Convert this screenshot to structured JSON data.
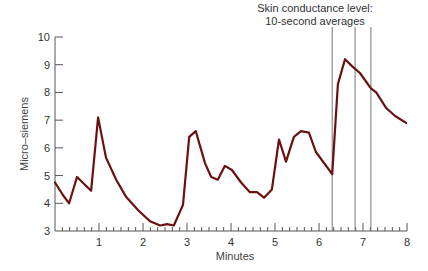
{
  "chart_data": {
    "type": "line",
    "title": "Skin conductance level:\n10-second averages",
    "title_lines": [
      "Skin conductance level:",
      "10-second averages"
    ],
    "xlabel": "Minutes",
    "ylabel": "Micro–siemens",
    "xlim": [
      0,
      8
    ],
    "ylim": [
      3,
      10
    ],
    "x_ticks": [
      1,
      2,
      3,
      4,
      5,
      6,
      7,
      8
    ],
    "y_ticks": [
      3,
      4,
      5,
      6,
      7,
      8,
      9,
      10
    ],
    "grid": false,
    "legend": null,
    "line_color": "#6b1010",
    "vertical_markers_minutes": [
      6.3,
      6.82,
      7.18
    ],
    "series": [
      {
        "name": "Skin conductance level",
        "x": [
          0,
          0.18,
          0.32,
          0.5,
          0.82,
          0.98,
          1.16,
          1.39,
          1.61,
          1.89,
          2.16,
          2.39,
          2.55,
          2.7,
          2.84,
          2.91,
          3.05,
          3.2,
          3.41,
          3.55,
          3.7,
          3.86,
          4.02,
          4.23,
          4.43,
          4.59,
          4.75,
          4.93,
          5.09,
          5.25,
          5.43,
          5.59,
          5.77,
          5.93,
          6.3,
          6.43,
          6.59,
          6.75,
          6.93,
          7.18,
          7.3,
          7.52,
          7.73,
          7.98
        ],
        "y": [
          4.75,
          4.3,
          4.0,
          4.95,
          4.45,
          7.1,
          5.65,
          4.85,
          4.25,
          3.75,
          3.35,
          3.2,
          3.25,
          3.2,
          3.7,
          3.95,
          6.4,
          6.6,
          5.45,
          4.95,
          4.85,
          5.35,
          5.2,
          4.75,
          4.4,
          4.4,
          4.2,
          4.5,
          6.3,
          5.5,
          6.4,
          6.6,
          6.55,
          5.85,
          5.05,
          8.3,
          9.2,
          8.95,
          8.7,
          8.15,
          8.0,
          7.45,
          7.15,
          6.9
        ]
      }
    ]
  }
}
